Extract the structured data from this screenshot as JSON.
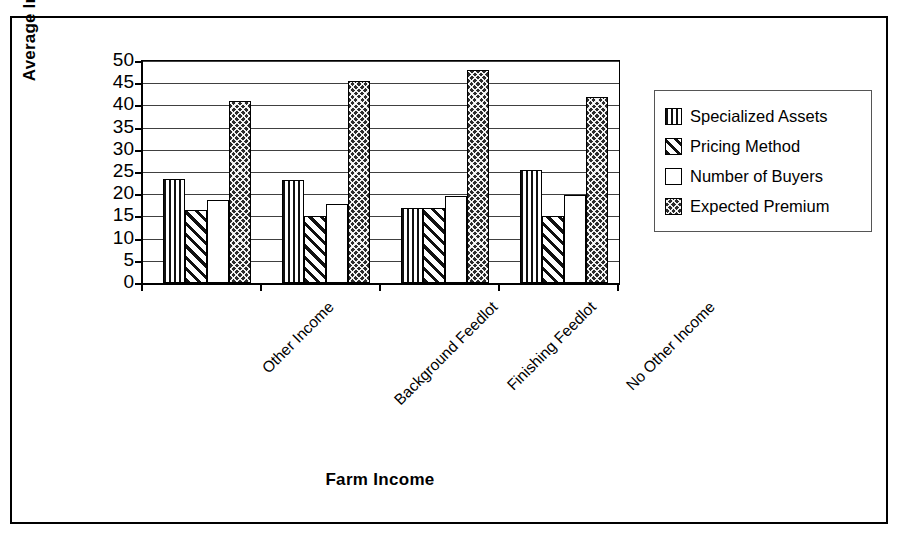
{
  "chart_data": {
    "type": "bar",
    "title": "",
    "xlabel": "Farm Income",
    "ylabel": "Average Importance",
    "categories": [
      "Other Income",
      "Background Feedlot",
      "Finishing Feedlot",
      "No Other Income"
    ],
    "series": [
      {
        "name": "Specialized Assets",
        "pattern": "vertical-stripes",
        "values": [
          23.5,
          23.2,
          17.0,
          25.5
        ]
      },
      {
        "name": "Pricing Method",
        "pattern": "diagonal-stripes",
        "values": [
          16.5,
          15.0,
          17.0,
          15.0
        ]
      },
      {
        "name": "Number of Buyers",
        "pattern": "white-empty",
        "values": [
          18.8,
          17.8,
          19.5,
          19.8
        ]
      },
      {
        "name": "Expected Premium",
        "pattern": "dark-checkered",
        "values": [
          41.0,
          45.5,
          48.0,
          42.0
        ]
      }
    ],
    "ylim": [
      0,
      50
    ],
    "yticks": [
      0,
      5,
      10,
      15,
      20,
      25,
      30,
      35,
      40,
      45,
      50
    ],
    "ytick_labels": [
      "0",
      "5",
      "10",
      "15",
      "20",
      "25",
      "30",
      "35",
      "40",
      "45",
      "50"
    ],
    "grid": true,
    "legend_position": "right",
    "legend_entries": [
      "Specialized Assets",
      "Pricing Method",
      "Number of Buyers",
      "Expected Premium"
    ]
  },
  "colors": {
    "axis": "#000000",
    "grid": "#000000",
    "bar_dark": "#2b2b2b",
    "bar_light": "#ffffff",
    "frame": "#000000"
  }
}
